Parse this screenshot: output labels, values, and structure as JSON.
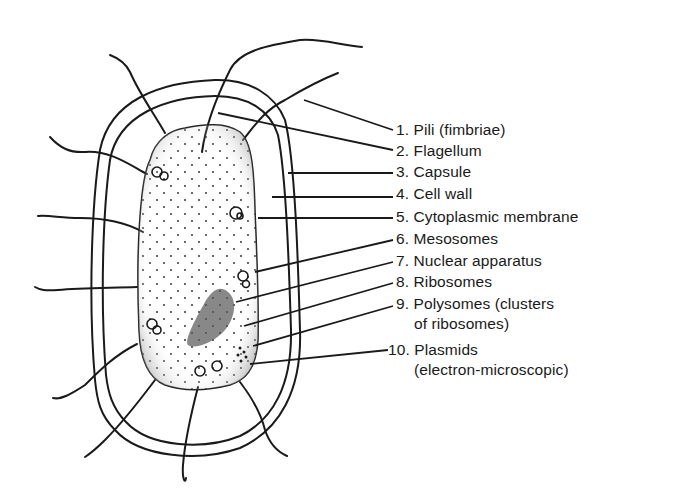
{
  "diagram": {
    "labels": [
      {
        "number": "1.",
        "text": "Pili (fimbriae)"
      },
      {
        "number": "2.",
        "text": "Flagellum"
      },
      {
        "number": "3.",
        "text": "Capsule"
      },
      {
        "number": "4.",
        "text": "Cell wall"
      },
      {
        "number": "5.",
        "text": "Cytoplasmic membrane"
      },
      {
        "number": "6.",
        "text": "Mesosomes"
      },
      {
        "number": "7.",
        "text": "Nuclear apparatus"
      },
      {
        "number": "8.",
        "text": "Ribosomes"
      },
      {
        "number": "9.",
        "text": "Polysomes (clusters",
        "continuation": "of ribosomes)"
      },
      {
        "number": "10.",
        "text": "Plasmids",
        "continuation": "(electron-microscopic)"
      }
    ],
    "colors": {
      "line": "#1a1a1a",
      "background": "#ffffff"
    }
  }
}
